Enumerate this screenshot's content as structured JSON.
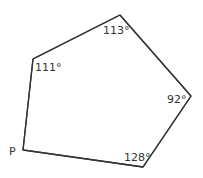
{
  "diagram": {
    "type": "pentagon",
    "vertex_label": "P",
    "angles": [
      "111°",
      "113°",
      "92°",
      "128°"
    ],
    "unknown_angle_vertex": "P",
    "colors": {
      "line": "#333333",
      "text": "#333333",
      "background": "#ffffff"
    }
  }
}
